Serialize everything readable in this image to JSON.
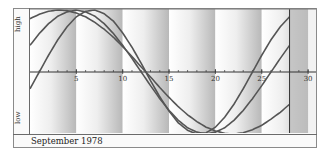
{
  "chart_data": {
    "type": "line",
    "title": "",
    "caption": "September 1978",
    "xlabel": "",
    "ylabel_top": "high",
    "ylabel_bottom": "low",
    "x_ticks": [
      5,
      10,
      15,
      20,
      25,
      30
    ],
    "xlim": [
      0,
      31
    ],
    "ylim": [
      -1,
      1
    ],
    "grid": false,
    "marker_day": 28,
    "x": [
      0,
      1,
      2,
      3,
      4,
      5,
      6,
      7,
      8,
      9,
      10,
      11,
      12,
      13,
      14,
      15,
      16,
      17,
      18,
      19,
      20,
      21,
      22,
      23,
      24,
      25,
      26,
      27,
      28
    ],
    "series": [
      {
        "name": "cycle-23",
        "period": 23,
        "values": [
          -0.27,
          0.0,
          0.27,
          0.52,
          0.73,
          0.89,
          0.98,
          1.0,
          0.94,
          0.82,
          0.63,
          0.4,
          0.14,
          -0.14,
          -0.4,
          -0.63,
          -0.82,
          -0.94,
          -1.0,
          -0.98,
          -0.89,
          -0.73,
          -0.52,
          -0.27,
          0.0,
          0.27,
          0.52,
          0.73,
          0.89
        ]
      },
      {
        "name": "cycle-28",
        "period": 28,
        "values": [
          0.43,
          0.62,
          0.78,
          0.9,
          0.97,
          1.0,
          0.97,
          0.9,
          0.78,
          0.62,
          0.43,
          0.22,
          0.0,
          -0.22,
          -0.43,
          -0.62,
          -0.78,
          -0.9,
          -0.97,
          -1.0,
          -0.97,
          -0.9,
          -0.78,
          -0.62,
          -0.43,
          -0.22,
          0.0,
          0.22,
          0.43
        ]
      },
      {
        "name": "cycle-33",
        "period": 33,
        "values": [
          0.86,
          0.93,
          0.98,
          1.0,
          0.99,
          0.95,
          0.89,
          0.8,
          0.69,
          0.56,
          0.41,
          0.25,
          0.08,
          -0.08,
          -0.25,
          -0.41,
          -0.56,
          -0.69,
          -0.8,
          -0.89,
          -0.95,
          -0.99,
          -1.0,
          -0.98,
          -0.93,
          -0.86,
          -0.76,
          -0.65,
          -0.52
        ]
      }
    ]
  },
  "labels": {
    "high": "high",
    "low": "low",
    "footer": "September 1978"
  }
}
